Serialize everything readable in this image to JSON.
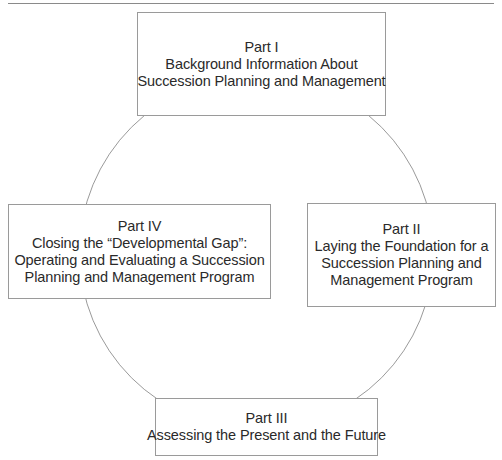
{
  "diagram": {
    "type": "cycle",
    "colors": {
      "stroke": "#9a9a9a",
      "text": "#2a2a2a",
      "background": "#ffffff"
    },
    "parts": [
      {
        "position": "top",
        "title": "Part I",
        "lines": [
          "Background Information About",
          "Succession Planning and Management"
        ]
      },
      {
        "position": "right",
        "title": "Part II",
        "lines": [
          "Laying the Foundation for a",
          "Succession Planning and",
          "Management Program"
        ]
      },
      {
        "position": "bottom",
        "title": "Part III",
        "lines": [
          "Assessing the Present and the Future"
        ]
      },
      {
        "position": "left",
        "title": "Part IV",
        "lines": [
          "Closing the “Developmental Gap”:",
          "Operating and Evaluating a Succession",
          "Planning and Management Program"
        ]
      }
    ]
  }
}
